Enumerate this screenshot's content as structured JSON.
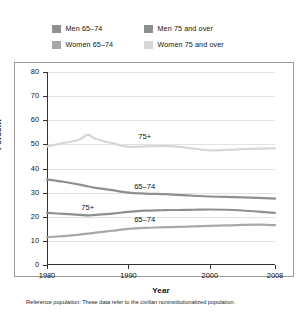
{
  "legend": {
    "items": [
      {
        "label": "Men 65–74",
        "color": "#8f8f8f",
        "key": "men-65-74"
      },
      {
        "label": "Men 75 and over",
        "color": "#8f8f8f",
        "key": "men-75-over"
      },
      {
        "label": "Women 65–74",
        "color": "#a8a8a8",
        "key": "women-65-74"
      },
      {
        "label": "Women 75 and over",
        "color": "#d6d6d6",
        "key": "women-75-over"
      }
    ]
  },
  "footnote": "Reference population: These data refer to the civilian noninstitutionalized population.",
  "chart_data": {
    "type": "line",
    "title": "",
    "xlabel": "Year",
    "ylabel": "Percent",
    "xlim": [
      1980,
      2008
    ],
    "ylim": [
      0,
      80
    ],
    "ytick_labels": [
      "0",
      "10",
      "20",
      "30",
      "40",
      "50",
      "60",
      "70",
      "80"
    ],
    "yticks": [
      0,
      10,
      20,
      30,
      40,
      50,
      60,
      70,
      80
    ],
    "xtick_labels": [
      "1980",
      "1990",
      "2000",
      "2008"
    ],
    "xticks": [
      1980,
      1990,
      2000,
      2008
    ],
    "grid": "horizontal",
    "legend_position": "above-plot",
    "x": [
      1980,
      1982,
      1984,
      1985,
      1986,
      1988,
      1990,
      1992,
      1994,
      1995,
      1996,
      1998,
      2000,
      2002,
      2004,
      2006,
      2008
    ],
    "series": [
      {
        "name": "Men 65–74",
        "color": "#8f8f8f",
        "annotation": "65–74",
        "annotation_x": 1992,
        "annotation_y": 32.5,
        "values": [
          35.5,
          34.5,
          33.3,
          32.6,
          32.0,
          31.0,
          30.0,
          29.6,
          29.4,
          29.3,
          29.1,
          28.7,
          28.4,
          28.2,
          28.0,
          27.8,
          27.5
        ]
      },
      {
        "name": "Men 75 and over",
        "color": "#8f8f8f",
        "annotation": "75+",
        "annotation_x": 1985,
        "annotation_y": 23.8,
        "values": [
          21.6,
          21.2,
          20.8,
          20.6,
          20.8,
          21.3,
          22.0,
          22.5,
          22.7,
          22.8,
          22.8,
          22.9,
          23.0,
          22.9,
          22.6,
          22.1,
          21.6
        ]
      },
      {
        "name": "Women 65–74",
        "color": "#a8a8a8",
        "annotation": "65–74",
        "annotation_x": 1992,
        "annotation_y": 18.7,
        "values": [
          11.5,
          12.0,
          12.6,
          13.0,
          13.4,
          14.2,
          15.0,
          15.4,
          15.6,
          15.7,
          15.8,
          16.0,
          16.2,
          16.4,
          16.6,
          16.7,
          16.5
        ]
      },
      {
        "name": "Women 75 and over",
        "color": "#d6d6d6",
        "annotation": "75+",
        "annotation_x": 1992,
        "annotation_y": 53.2,
        "values": [
          49.2,
          50.5,
          52.0,
          54.0,
          52.2,
          50.5,
          49.0,
          49.2,
          49.3,
          49.3,
          49.1,
          48.3,
          47.5,
          47.7,
          48.0,
          48.2,
          48.4
        ]
      }
    ]
  }
}
